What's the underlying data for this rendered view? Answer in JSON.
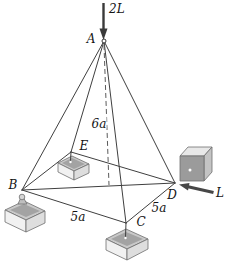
{
  "figure": {
    "joints": {
      "A": "A",
      "B": "B",
      "C": "C",
      "D": "D",
      "E": "E"
    },
    "forces": {
      "at_A": "2L",
      "at_D": "L"
    },
    "dimensions": {
      "altitude": "6a",
      "edge_BC": "5a",
      "edge_CD": "5a"
    },
    "colors": {
      "member_line": "#3f3f3f",
      "dashed_line": "#5a5a5a",
      "force_arrow": "#3a3a3a",
      "footing_top": "#c9c9c9",
      "footing_top_inset": "#a3a3a3",
      "footing_front": "#f1f1f1",
      "cube_front": "#9b9b9b",
      "cube_top": "#e8e8e8",
      "cube_right": "#c4c4c4",
      "background": "#ffffff",
      "label_text": "#141414"
    }
  }
}
